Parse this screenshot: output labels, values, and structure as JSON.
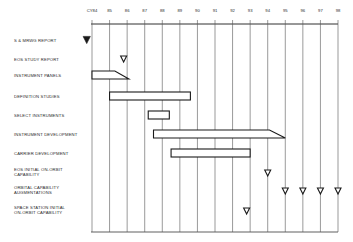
{
  "chart_data": {
    "type": "gantt",
    "title": "",
    "xlabel": "Calendar Year",
    "x_ticks": [
      "CY84",
      "85",
      "86",
      "87",
      "88",
      "89",
      "90",
      "91",
      "92",
      "93",
      "94",
      "95",
      "96",
      "97",
      "98"
    ],
    "x_range": [
      1984,
      1998
    ],
    "grid": true,
    "rows": [
      {
        "label": "S & MRWG REPORT",
        "type": "milestone",
        "style": "filled",
        "at": 1983.7
      },
      {
        "label": "EOS STUDY REPORT",
        "type": "milestone",
        "style": "open",
        "at": 1985.8
      },
      {
        "label": "INSTRUMENT PANELS",
        "type": "bar",
        "start": 1984.0,
        "end_top": 1985.3,
        "end_bottom": 1986.1,
        "tapered": true
      },
      {
        "label": "DEFINITION STUDIES",
        "type": "bar",
        "start": 1985.0,
        "end": 1989.6
      },
      {
        "label": "SELECT INSTRUMENTS",
        "type": "bar",
        "start": 1987.2,
        "end": 1988.4
      },
      {
        "label": "INSTRUMENT DEVELOPMENT",
        "type": "bar",
        "start": 1987.5,
        "end_top": 1994.1,
        "end_bottom": 1995.0,
        "tapered": true
      },
      {
        "label": "CARRIER DEVELOPMENT",
        "type": "bar",
        "start": 1988.5,
        "end": 1993.0
      },
      {
        "label": "EOS INITIAL ON-ORBIT\nCAPABILITY",
        "type": "milestone",
        "style": "open",
        "at": 1994.0
      },
      {
        "label": "ORBITAL CAPABILITY\nAUGMENTATIONS",
        "type": "milestones",
        "style": "open",
        "at": [
          1995.0,
          1996.0,
          1997.0,
          1998.0
        ]
      },
      {
        "label": "SPACE STATION INITIAL\nON-ORBIT CAPABILITY",
        "type": "milestone",
        "style": "open",
        "at": 1992.8
      }
    ]
  },
  "colors": {
    "ink": "#1a1a1a",
    "grid": "#555555",
    "background": "#ffffff"
  }
}
